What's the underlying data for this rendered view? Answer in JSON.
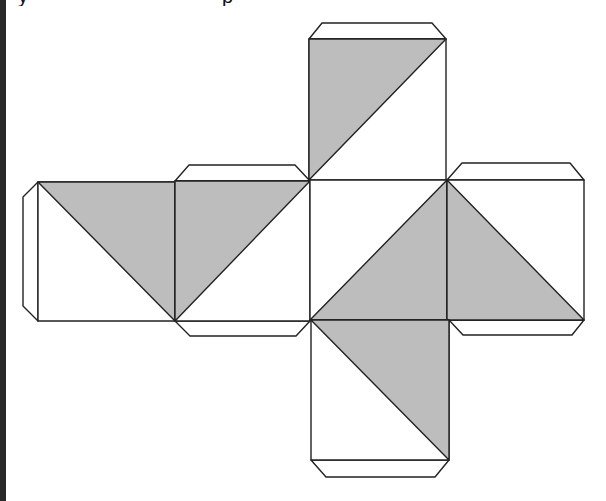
{
  "caption": {
    "visible_fragments": [
      "y",
      "p"
    ],
    "note_cropped": true
  },
  "colors": {
    "shade": "#bdbdbd",
    "stroke": "#222222",
    "face": "#ffffff",
    "strip": "#2a2a2a"
  },
  "net": {
    "type": "cube-net",
    "faces": [
      {
        "id": "top",
        "square": [
          [
            309,
            39
          ],
          [
            446,
            39
          ],
          [
            446,
            180
          ],
          [
            309,
            180
          ]
        ],
        "shaded": [
          [
            309,
            39
          ],
          [
            446,
            39
          ],
          [
            309,
            180
          ]
        ]
      },
      {
        "id": "left",
        "square": [
          [
            38,
            182
          ],
          [
            175,
            182
          ],
          [
            175,
            321
          ],
          [
            38,
            321
          ]
        ],
        "shaded": [
          [
            38,
            182
          ],
          [
            175,
            182
          ],
          [
            175,
            321
          ]
        ]
      },
      {
        "id": "center-left",
        "square": [
          [
            175,
            181
          ],
          [
            310,
            181
          ],
          [
            310,
            321
          ],
          [
            175,
            321
          ]
        ],
        "shaded": [
          [
            175,
            181
          ],
          [
            310,
            181
          ],
          [
            175,
            321
          ]
        ]
      },
      {
        "id": "center",
        "square": [
          [
            310,
            180
          ],
          [
            447,
            180
          ],
          [
            447,
            320
          ],
          [
            310,
            320
          ]
        ],
        "shaded": [
          [
            447,
            180
          ],
          [
            447,
            320
          ],
          [
            310,
            320
          ]
        ]
      },
      {
        "id": "right",
        "square": [
          [
            447,
            180
          ],
          [
            584,
            180
          ],
          [
            584,
            320
          ],
          [
            447,
            320
          ]
        ],
        "shaded": [
          [
            447,
            180
          ],
          [
            447,
            320
          ],
          [
            584,
            320
          ]
        ]
      },
      {
        "id": "bottom",
        "square": [
          [
            311,
            320
          ],
          [
            449,
            320
          ],
          [
            449,
            460
          ],
          [
            311,
            460
          ]
        ],
        "shaded": [
          [
            311,
            320
          ],
          [
            449,
            320
          ],
          [
            449,
            460
          ]
        ]
      }
    ],
    "flaps": [
      {
        "id": "flap-top",
        "points": [
          [
            309,
            39
          ],
          [
            322,
            23
          ],
          [
            432,
            23
          ],
          [
            446,
            39
          ]
        ]
      },
      {
        "id": "flap-center-left-top",
        "points": [
          [
            175,
            181
          ],
          [
            189,
            165
          ],
          [
            295,
            165
          ],
          [
            310,
            181
          ]
        ]
      },
      {
        "id": "flap-right-top",
        "points": [
          [
            447,
            180
          ],
          [
            462,
            163
          ],
          [
            570,
            163
          ],
          [
            584,
            180
          ]
        ]
      },
      {
        "id": "flap-left",
        "points": [
          [
            38,
            182
          ],
          [
            23,
            197
          ],
          [
            23,
            306
          ],
          [
            38,
            321
          ]
        ]
      },
      {
        "id": "flap-center-left-bottom",
        "points": [
          [
            175,
            321
          ],
          [
            190,
            336
          ],
          [
            296,
            336
          ],
          [
            310,
            321
          ]
        ]
      },
      {
        "id": "flap-right-bottom",
        "points": [
          [
            449,
            320
          ],
          [
            463,
            335
          ],
          [
            572,
            335
          ],
          [
            584,
            320
          ]
        ]
      },
      {
        "id": "flap-bottom",
        "points": [
          [
            311,
            460
          ],
          [
            326,
            477
          ],
          [
            435,
            477
          ],
          [
            449,
            460
          ]
        ]
      }
    ]
  }
}
